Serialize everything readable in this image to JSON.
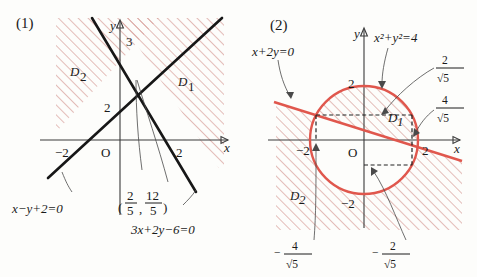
{
  "page": {
    "background": "#fdfdfb",
    "hatch_color": "#d08c86",
    "curve_red": "#e0574d",
    "line_black": "#171717"
  },
  "figure1": {
    "number": "(1)",
    "region_labels": {
      "d1": "D",
      "d1_sub": "1",
      "d2": "D",
      "d2_sub": "2"
    },
    "axis_x_label": "x",
    "axis_y_label": "y",
    "x_ticks": [
      "-2",
      "2"
    ],
    "x_tick_minus2": "−2",
    "x_tick_2": "2",
    "origin_label": "O",
    "y_ticks": [
      "2",
      "3"
    ],
    "y_tick_2": "2",
    "y_tick_3": "3",
    "equation_line1": "x−y+2=0",
    "equation_line2": "3x+2y−6=0",
    "intersection_point": {
      "open_paren": "(",
      "close_paren": ")",
      "comma": ",",
      "x_num": "2",
      "x_den": "5",
      "y_num": "12",
      "y_den": "5"
    }
  },
  "figure2": {
    "number": "(2)",
    "region_labels": {
      "d1": "D",
      "d1_sub": "1",
      "d2": "D",
      "d2_sub": "2"
    },
    "axis_x_label": "x",
    "axis_y_label": "y",
    "origin_label": "O",
    "x_tick_minus2": "−2",
    "x_tick_2": "2",
    "y_tick_2": "2",
    "y_tick_minus2": "−2",
    "equation_line": "x+2y=0",
    "equation_circle_base": "x",
    "equation_circle": "x²+y²=4",
    "frac_right_top": {
      "num": "2",
      "den": "√5"
    },
    "frac_right_bottom": {
      "num": "4",
      "den": "√5"
    },
    "frac_bottom_left": {
      "sign": "−",
      "num": "4",
      "den": "√5"
    },
    "frac_bottom_right": {
      "sign": "−",
      "num": "2",
      "den": "√5"
    }
  }
}
